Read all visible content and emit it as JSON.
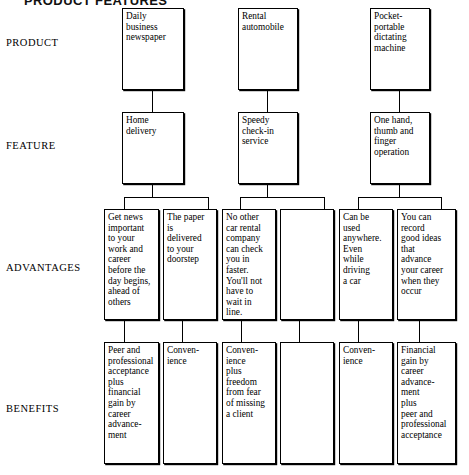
{
  "title": "PRODUCT FEATURES",
  "row_labels": [
    {
      "id": "product",
      "label": "PRODUCT",
      "top": 37
    },
    {
      "id": "feature",
      "label": "FEATURE",
      "top": 140
    },
    {
      "id": "advantages",
      "label": "ADVANTAGES",
      "top": 262
    },
    {
      "id": "benefits",
      "label": "BENEFITS",
      "top": 403
    }
  ],
  "rows": {
    "product": {
      "boxes": [
        {
          "id": "product-newspaper",
          "text": "Daily\nbusiness\nnewspaper"
        },
        {
          "id": "product-rental-car",
          "text": "Rental\nautomobile"
        },
        {
          "id": "product-dictating-machine",
          "text": "Pocket-\nportable\ndictating\nmachine"
        }
      ]
    },
    "feature": {
      "boxes": [
        {
          "id": "feature-home-delivery",
          "text": "Home\ndelivery"
        },
        {
          "id": "feature-speedy-checkin",
          "text": "Speedy\ncheck-in\nservice"
        },
        {
          "id": "feature-one-hand-operation",
          "text": "One hand,\nthumb and\nfinger\noperation"
        }
      ]
    },
    "advantages": {
      "boxes": [
        {
          "id": "advantage-get-news",
          "text": "Get news\nimportant\nto your\nwork and\ncareer\nbefore the\nday begins,\nahead of\nothers"
        },
        {
          "id": "advantage-paper-delivered",
          "text": "The paper\nis\ndelivered\nto your\ndoorstep"
        },
        {
          "id": "advantage-fastest-checkin",
          "text": "No other\ncar rental\ncompany\ncan check\nyou in\nfaster.\nYou'll not\nhave to\nwait in\nline."
        },
        {
          "id": "advantage-blank",
          "text": ""
        },
        {
          "id": "advantage-used-anywhere",
          "text": "Can be\nused\nanywhere.\nEven\nwhile\ndriving\na car"
        },
        {
          "id": "advantage-record-ideas",
          "text": "You can\nrecord\ngood ideas\nthat\nadvance\nyour career\nwhen they\noccur"
        }
      ]
    },
    "benefits": {
      "boxes": [
        {
          "id": "benefit-peer-acceptance",
          "text": "Peer and\nprofessional\nacceptance\nplus\nfinancial\ngain by\ncareer\nadvance-\nment"
        },
        {
          "id": "benefit-convenience-1",
          "text": "Conven-\nience"
        },
        {
          "id": "benefit-convenience-freedom",
          "text": "Conven-\nience\nplus\nfreedom\nfrom fear\nof missing\na client"
        },
        {
          "id": "benefit-blank",
          "text": ""
        },
        {
          "id": "benefit-convenience-2",
          "text": "Conven-\nience"
        },
        {
          "id": "benefit-financial-gain",
          "text": "Financial\ngain by\ncareer\nadvance-\nment\nplus\npeer and\nprofessional\nacceptance"
        }
      ]
    }
  },
  "colors": {
    "ink": "#000000",
    "paper": "#ffffff"
  }
}
